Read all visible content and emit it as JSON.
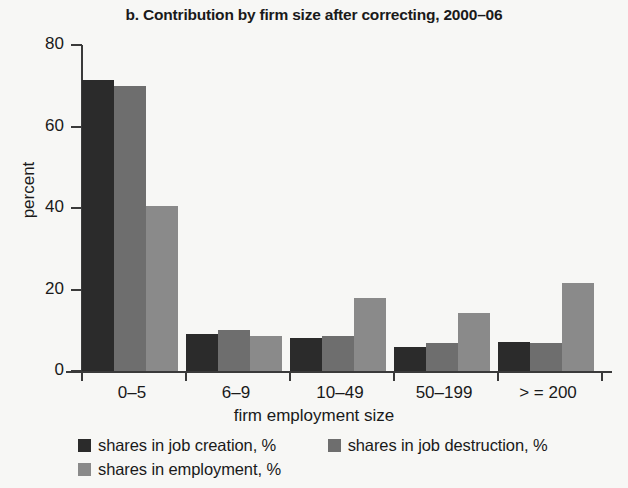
{
  "chart_data": {
    "type": "bar",
    "title": "b. Contribution by firm size after correcting, 2000–06",
    "xlabel": "firm employment size",
    "ylabel": "percent",
    "categories": [
      "0–5",
      "6–9",
      "10–49",
      "50–199",
      "> = 200"
    ],
    "series": [
      {
        "name": "shares in job creation, %",
        "color": "#2b2b2b",
        "values": [
          71.5,
          9.0,
          8.0,
          5.8,
          7.2
        ]
      },
      {
        "name": "shares in job destruction, %",
        "color": "#6e6e6e",
        "values": [
          70.0,
          10.0,
          8.5,
          6.8,
          6.8
        ]
      },
      {
        "name": "shares in employment, %",
        "color": "#8a8a8a",
        "values": [
          40.5,
          8.5,
          17.8,
          14.3,
          21.5
        ]
      }
    ],
    "ylim": [
      0,
      80
    ],
    "yticks": [
      0,
      20,
      40,
      60,
      80
    ],
    "ytick_labels": [
      "0",
      "20",
      "40",
      "60",
      "80"
    ],
    "grid": false,
    "legend_position": "bottom-left"
  },
  "axis": {
    "y_title": "percent",
    "x_title": "firm employment size",
    "y_labels": [
      "80",
      "60",
      "40",
      "20",
      "0"
    ],
    "x_labels": [
      "0–5",
      "6–9",
      "10–49",
      "50–199",
      "> = 200"
    ]
  },
  "legend": {
    "items": [
      {
        "label": "shares in job creation, %",
        "color": "#2b2b2b"
      },
      {
        "label": "shares in job destruction, %",
        "color": "#6e6e6e"
      },
      {
        "label": "shares in employment, %",
        "color": "#8a8a8a"
      }
    ]
  },
  "colors": {
    "background": "#f7f7f5",
    "axis": "#3a3a3a",
    "text": "#1a1a1a",
    "series_job_creation": "#2b2b2b",
    "series_job_destruction": "#6e6e6e",
    "series_employment": "#8a8a8a"
  }
}
